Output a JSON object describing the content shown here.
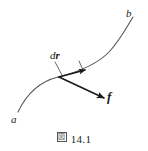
{
  "figure": {
    "caption_mark": "図",
    "caption_number": "14.1",
    "background_color": "#ffffff",
    "stroke_color": "#4a4a4a",
    "arrow_color": "#1a1a1a",
    "text_color": "#1a1a1a",
    "labels": {
      "start_point": "a",
      "end_point": "b",
      "displacement_vector_d": "d",
      "displacement_vector_r": "r",
      "force_vector": "f"
    },
    "curve": {
      "description": "smooth path from a to b",
      "path": "M 18 112 C 28 92, 42 80, 60 76 C 80 72, 98 66, 112 50 C 122 38, 128 26, 133 18"
    },
    "vectors": [
      {
        "name": "dr",
        "label": "dr",
        "start": [
          60,
          77
        ],
        "end": [
          85,
          70
        ],
        "description": "tangent displacement arrow along curve"
      },
      {
        "name": "f",
        "label": "f",
        "start": [
          60,
          77
        ],
        "end": [
          105,
          99
        ],
        "description": "force arrow at angle from curve"
      }
    ],
    "leader_lines": [
      {
        "from": [
          56,
          62
        ],
        "to": [
          62,
          74
        ]
      },
      {
        "from": [
          78,
          61
        ],
        "to": [
          82,
          70
        ]
      }
    ]
  }
}
